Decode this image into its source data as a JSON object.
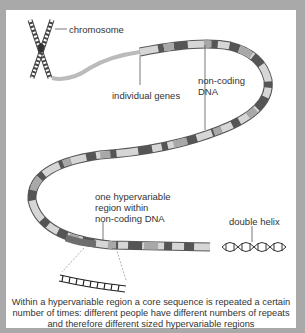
{
  "labels": {
    "chromosome": "chromosome",
    "individual_genes": "individual genes",
    "non_coding_line1": "non-coding",
    "non_coding_line2": "DNA",
    "hypervariable_line1": "one hypervariable",
    "hypervariable_line2": "region within",
    "hypervariable_line3": "non-coding DNA",
    "double_helix": "double helix"
  },
  "caption": {
    "line1": "Within a hypervariable region a core sequence is repeated a certain",
    "line2": "number of times: different people have different numbers of repeats",
    "line3": "and therefore different sized hypervariable regions"
  },
  "colors": {
    "frame": "#a9a9a9",
    "background": "#ffffff",
    "ribbon_light": "#d6d6d6",
    "ribbon_mid": "#a8a8a8",
    "ribbon_dark": "#6e6e6e",
    "text": "#333333"
  }
}
